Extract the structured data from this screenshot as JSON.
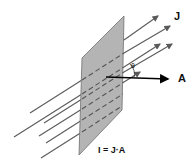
{
  "diagram": {
    "labels": {
      "current_density": "J",
      "area_vector": "A",
      "angle": "θ",
      "equation": "I = J·A"
    },
    "colors": {
      "plate_fill": "#b4b4b4",
      "plate_edge": "#6e6e6e",
      "field_lines": "#5a5a5a",
      "area_arrow": "#000000"
    }
  }
}
